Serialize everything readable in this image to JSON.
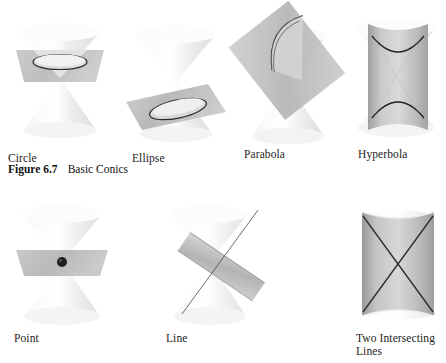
{
  "figure": {
    "caption_number": "Figure 6.7",
    "caption_title": "Basic Conics"
  },
  "palette": {
    "cone_light": "#ffffff",
    "cone_shade": "#e8e8e8",
    "cone_edge": "#cfcfcf",
    "plane_fill": "#b9b9b9",
    "plane_fill_light": "#d6d6d6",
    "plane_edge": "#8f8f8f",
    "curve_stroke": "#2a2a2a",
    "text": "#1d1d1d",
    "background": "#ffffff"
  },
  "panels": [
    {
      "id": "circle",
      "label": "Circle",
      "row": 1,
      "col": 1,
      "icon": "double-cone-horizontal-plane"
    },
    {
      "id": "ellipse",
      "label": "Ellipse",
      "row": 1,
      "col": 2,
      "icon": "double-cone-tilted-plane"
    },
    {
      "id": "parabola",
      "label": "Parabola",
      "row": 1,
      "col": 3,
      "icon": "double-cone-steep-plane"
    },
    {
      "id": "hyperbola",
      "label": "Hyperbola",
      "row": 1,
      "col": 4,
      "icon": "double-cone-vertical-plane"
    },
    {
      "id": "point",
      "label": "Point",
      "row": 2,
      "col": 1,
      "icon": "double-cone-apex-plane"
    },
    {
      "id": "line",
      "label": "Line",
      "row": 2,
      "col": 2,
      "icon": "double-cone-tangent-plane"
    },
    {
      "id": "two-intersecting",
      "label": "Two Intersecting\nLines",
      "row": 2,
      "col": 3,
      "icon": "double-cone-axial-plane"
    }
  ]
}
